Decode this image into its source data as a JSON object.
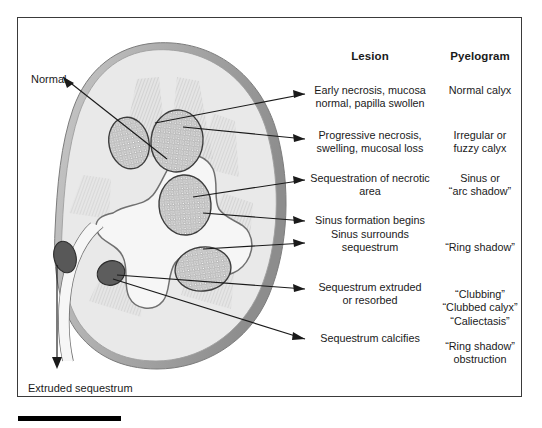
{
  "figure": {
    "title_headers": {
      "lesion": "Lesion",
      "pyelogram": "Pyelogram"
    },
    "side_labels": {
      "normal": "Normal",
      "extruded": "Extruded sequestrum"
    },
    "rows": [
      {
        "lesion": "Early necrosis, mucosa\nnormal, papilla swollen",
        "pyelogram": "Normal calyx"
      },
      {
        "lesion": "Progressive necrosis,\nswelling, mucosal loss",
        "pyelogram": "Irregular or\nfuzzy calyx"
      },
      {
        "lesion": "Sequestration of necrotic\narea",
        "pyelogram": "Sinus or\n“arc shadow”"
      },
      {
        "lesion": "Sinus formation begins",
        "pyelogram": ""
      },
      {
        "lesion": "Sinus surrounds\nsequestrum",
        "pyelogram": "“Ring shadow”"
      },
      {
        "lesion": "Sequestrum extruded\nor resorbed",
        "pyelogram": "“Clubbing”\n“Clubbed calyx”\n“Caliectasis”"
      },
      {
        "lesion": "Sequestrum calcifies",
        "pyelogram": "“Ring shadow”\nobstruction"
      }
    ],
    "colors": {
      "frame_border": "#3a3a3a",
      "cortex": "#e8e8e8",
      "capsule": "#9a9a9a",
      "medulla": "#d2d2d2",
      "sequestrum_dark": "#5a5a5a",
      "papilla_stipple": "#8f8f8f",
      "collecting_system": "#f4f4f4",
      "leader_line": "#1a1a1a",
      "footer_rule": "#000000",
      "background": "#ffffff"
    }
  }
}
